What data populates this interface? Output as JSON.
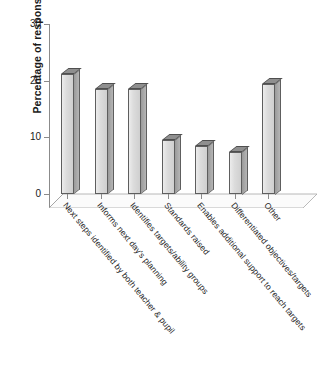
{
  "chart_data": {
    "type": "bar",
    "title": "",
    "xlabel": "",
    "ylabel": "Percentage of responses",
    "ylim": [
      0,
      30
    ],
    "yticks": [
      0,
      10,
      20,
      30
    ],
    "grid": false,
    "legend": null,
    "style": "3d-column",
    "categories": [
      "Next steps identified by both teacher & pupil",
      "Informs next day's planning",
      "Identifies targets/ability groups",
      "Standards raised",
      "Enables additional support to reach targets",
      "Differentiated objectives/targets",
      "Other"
    ],
    "values": [
      21.2,
      18.6,
      18.6,
      9.5,
      8.5,
      7.5,
      19.5
    ],
    "ytick_labels": [
      "0",
      "10",
      "20",
      "30"
    ]
  },
  "colors": {
    "bar_face": "#dcdcdc",
    "bar_side": "#a5a5a5",
    "bar_top": "#8f8f8f",
    "bar_edge": "#5e5e5e",
    "axis": "#8b8b8b",
    "text": "#1a1a1a",
    "background": "#ffffff"
  },
  "caption": ""
}
